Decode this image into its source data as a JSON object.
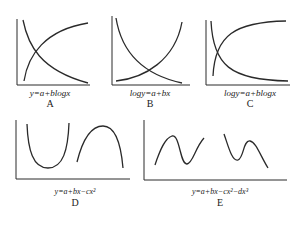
{
  "panels": [
    {
      "id": "A",
      "equation": "y=a+blogx",
      "letter": "A"
    },
    {
      "id": "B",
      "equation": "logy=a+bx",
      "letter": "B"
    },
    {
      "id": "C",
      "equation": "logy=a+blogx",
      "letter": "C"
    },
    {
      "id": "D",
      "equation": "y=a+bx−cx²",
      "letter": "D"
    },
    {
      "id": "E",
      "equation": "y=a+bx−cx²−dx³",
      "letter": "E"
    }
  ],
  "colors": {
    "stroke": "#2a2a2a",
    "background": "#ffffff"
  }
}
